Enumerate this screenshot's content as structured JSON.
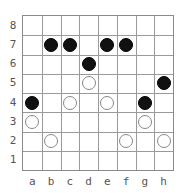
{
  "board": {
    "files": [
      "a",
      "b",
      "c",
      "d",
      "e",
      "f",
      "g",
      "h"
    ],
    "ranks": [
      "8",
      "7",
      "6",
      "5",
      "4",
      "3",
      "2",
      "1"
    ],
    "colors": {
      "black": "#111111",
      "white": "#ffffff",
      "grid": "#9a9a9a"
    },
    "stones": [
      {
        "square": "b7",
        "color": "black"
      },
      {
        "square": "c7",
        "color": "black"
      },
      {
        "square": "e7",
        "color": "black"
      },
      {
        "square": "f7",
        "color": "black"
      },
      {
        "square": "d6",
        "color": "black"
      },
      {
        "square": "h5",
        "color": "black"
      },
      {
        "square": "a4",
        "color": "black"
      },
      {
        "square": "g4",
        "color": "black"
      },
      {
        "square": "d5",
        "color": "white"
      },
      {
        "square": "c4",
        "color": "white"
      },
      {
        "square": "e4",
        "color": "white"
      },
      {
        "square": "a3",
        "color": "white"
      },
      {
        "square": "g3",
        "color": "white"
      },
      {
        "square": "b2",
        "color": "white"
      },
      {
        "square": "f2",
        "color": "white"
      },
      {
        "square": "h2",
        "color": "white"
      }
    ]
  }
}
